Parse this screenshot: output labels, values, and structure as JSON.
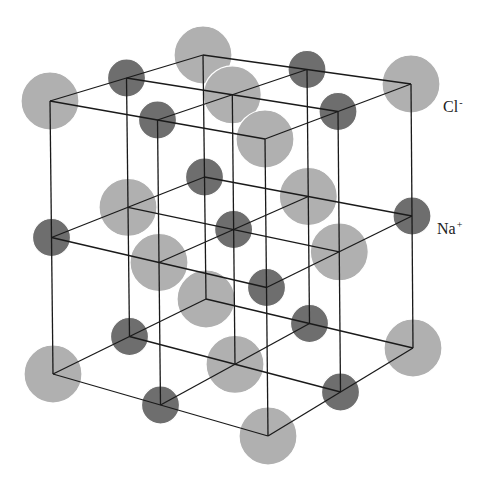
{
  "diagram": {
    "labels": [
      {
        "id": "cl",
        "ion": "Cl",
        "charge": "-",
        "x": 443,
        "y": 98
      },
      {
        "id": "na",
        "ion": "Na",
        "charge": "+",
        "x": 437,
        "y": 220
      }
    ],
    "colors": {
      "cl": "#b0b0b0",
      "na": "#6e6e6e",
      "line": "#1a1a1a",
      "outline": "#ffffff"
    },
    "radii": {
      "cl": 29,
      "na": 19
    },
    "corners": {
      "top": {
        "p00": [
          50,
          101
        ],
        "p20": [
          203,
          55
        ],
        "p02": [
          265,
          139
        ],
        "p22": [
          411,
          84
        ]
      },
      "bottom": {
        "p00": [
          53,
          374
        ],
        "p20": [
          206,
          299
        ],
        "p02": [
          268,
          436
        ],
        "p22": [
          413,
          348
        ]
      }
    },
    "grid_size": 3,
    "corner_ion": "cl"
  }
}
